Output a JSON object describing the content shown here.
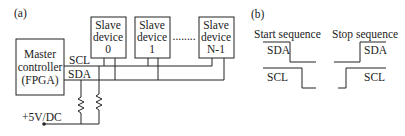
{
  "panel_a": {
    "label": "(a)",
    "master": {
      "line1": "Master",
      "line2": "controller",
      "line3": "(FPGA)"
    },
    "slaves": [
      {
        "line1": "Slave",
        "line2": "device",
        "line3": "0"
      },
      {
        "line1": "Slave",
        "line2": "device",
        "line3": "1"
      },
      {
        "line1": "Slave",
        "line2": "device",
        "line3": "N-1"
      }
    ],
    "ellipsis": "........",
    "scl_label": "SCL",
    "sda_label": "SDA",
    "supply_label": "+5V/DC"
  },
  "panel_b": {
    "label": "(b)",
    "start_title": "Start sequence",
    "stop_title": "Stop sequence",
    "sda_label": "SDA",
    "scl_label": "SCL"
  }
}
